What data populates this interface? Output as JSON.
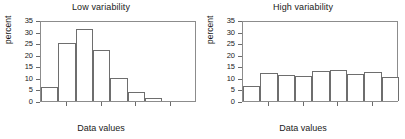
{
  "figure": {
    "width": 405,
    "height": 139,
    "background": "#ffffff",
    "frame_color": "#8c8c8c",
    "bar_edge_color": "#6e6e6e",
    "bar_fill_color": "#ffffff",
    "text_color": "#1a1a1a"
  },
  "chart_data": [
    {
      "type": "bar",
      "title": "Low variability",
      "xlabel": "Data values",
      "ylabel": "percent",
      "ylim": [
        0,
        35
      ],
      "yticks": [
        0,
        5,
        10,
        15,
        20,
        25,
        30,
        35
      ],
      "ytick_labels": [
        "0",
        "5",
        "10",
        "15",
        "20",
        "25",
        "30",
        "35"
      ],
      "grid": false,
      "legend": "none",
      "bin_count": 9,
      "bin_index": [
        1,
        2,
        3,
        4,
        5,
        6,
        7,
        8,
        9
      ],
      "values": [
        6,
        25,
        31,
        22,
        10,
        4,
        1.5,
        0,
        0
      ],
      "xtick_positions": [
        1.5,
        3.5,
        5.5,
        7.5
      ],
      "notes": "Histogram concentrated in the low-middle bins; tall narrow distribution."
    },
    {
      "type": "bar",
      "title": "High variability",
      "xlabel": "Data values",
      "ylabel": "percent",
      "ylim": [
        0,
        35
      ],
      "yticks": [
        0,
        5,
        10,
        15,
        20,
        25,
        30,
        35
      ],
      "ytick_labels": [
        "0",
        "5",
        "10",
        "15",
        "20",
        "25",
        "30",
        "35"
      ],
      "grid": false,
      "legend": "none",
      "bin_count": 9,
      "bin_index": [
        1,
        2,
        3,
        4,
        5,
        6,
        7,
        8,
        9
      ],
      "values": [
        6.5,
        12,
        11.2,
        11,
        13,
        13.3,
        11.5,
        12.5,
        10.5
      ],
      "xtick_positions": [
        1.5,
        3.5,
        5.5,
        7.5
      ],
      "notes": "Histogram nearly flat/uniform across bins; wide spread distribution."
    }
  ]
}
